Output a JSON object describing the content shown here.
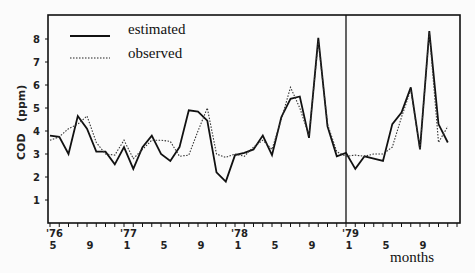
{
  "chart_data": {
    "type": "line",
    "title": "",
    "xlabel": "months",
    "ylabel": "COD   (ppm)",
    "ylim": [
      0,
      8.6
    ],
    "yticks": [
      1,
      2,
      3,
      4,
      5,
      6,
      7,
      8
    ],
    "grid": false,
    "legend_position": "top-left",
    "x_start": "1976-05",
    "x_tick_labels": [
      {
        "month_index": 0,
        "year": "'76",
        "month": "5"
      },
      {
        "month_index": 4,
        "year": "",
        "month": "9"
      },
      {
        "month_index": 8,
        "year": "'77",
        "month": "1"
      },
      {
        "month_index": 12,
        "year": "",
        "month": "5"
      },
      {
        "month_index": 16,
        "year": "",
        "month": "9"
      },
      {
        "month_index": 20,
        "year": "'78",
        "month": "1"
      },
      {
        "month_index": 24,
        "year": "",
        "month": "5"
      },
      {
        "month_index": 28,
        "year": "",
        "month": "9"
      },
      {
        "month_index": 32,
        "year": "'79",
        "month": "1"
      },
      {
        "month_index": 36,
        "year": "",
        "month": "5"
      },
      {
        "month_index": 40,
        "year": "",
        "month": "9"
      }
    ],
    "divider_month_index": 32,
    "n_months": 45,
    "series": [
      {
        "name": "estimated",
        "style": "solid",
        "values": [
          3.8,
          3.75,
          3.0,
          4.65,
          4.1,
          3.1,
          3.1,
          2.55,
          3.3,
          2.35,
          3.3,
          3.8,
          3.0,
          2.7,
          3.3,
          4.9,
          4.85,
          4.45,
          2.2,
          1.8,
          2.95,
          3.05,
          3.2,
          3.8,
          2.95,
          4.6,
          5.4,
          5.5,
          3.7,
          8.05,
          4.2,
          2.9,
          3.05,
          2.35,
          2.9,
          2.8,
          2.7,
          4.3,
          4.8,
          5.9,
          3.2,
          8.35,
          4.3,
          3.5,
          3.0,
          3.05
        ]
      },
      {
        "name": "observed",
        "style": "dotted",
        "values": [
          3.6,
          3.75,
          4.1,
          4.3,
          4.65,
          3.5,
          3.0,
          2.95,
          3.6,
          2.8,
          3.2,
          3.6,
          3.6,
          3.55,
          2.9,
          2.95,
          4.0,
          5.0,
          3.0,
          2.85,
          3.0,
          2.9,
          3.3,
          3.6,
          3.2,
          4.5,
          5.9,
          5.0,
          3.8,
          7.9,
          4.3,
          3.1,
          2.9,
          2.95,
          2.9,
          3.0,
          3.0,
          3.3,
          4.6,
          5.8,
          3.2,
          8.3,
          3.5,
          4.2,
          3.1,
          3.0
        ]
      }
    ]
  }
}
